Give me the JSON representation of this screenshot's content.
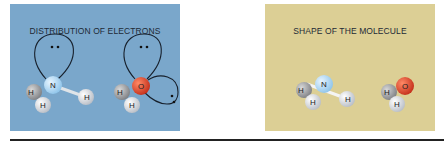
{
  "colors": {
    "blue_panel": "#7aa7cb",
    "tan_panel": "#dccf95",
    "nitrogen": "#a9d3ee",
    "oxygen": "#d9412a",
    "hydrogen": "#e4e6ea",
    "orbital": "#17202c"
  },
  "left_panel": {
    "title": "DISTRIBUTION OF ELECTRONS",
    "ammonia": {
      "central": "N",
      "hydrogens": [
        "H",
        "H",
        "H"
      ],
      "lone_pairs": 1
    },
    "water": {
      "central": "O",
      "hydrogens": [
        "H",
        "H"
      ],
      "lone_pairs": 2
    }
  },
  "right_panel": {
    "title": "SHAPE OF THE MOLECULE",
    "ammonia": {
      "central": "N",
      "hydrogens": [
        "H",
        "H",
        "H"
      ]
    },
    "water": {
      "central": "O",
      "hydrogens": [
        "H",
        "H"
      ]
    }
  }
}
